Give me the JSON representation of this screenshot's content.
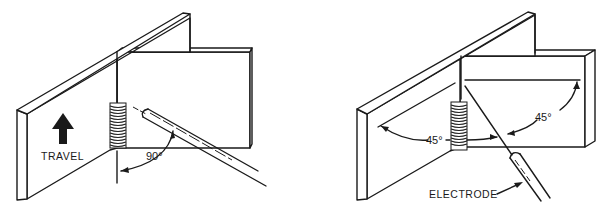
{
  "figures": [
    {
      "id": "left",
      "description": "Vertical fillet weld, electrode perpendicular to plate",
      "travel_label": "TRAVEL",
      "angle_label": "90°"
    },
    {
      "id": "right",
      "description": "Vertical fillet weld, electrode bisecting joint",
      "angle_label_left": "45°",
      "angle_label_right": "45°",
      "electrode_label": "ELECTRODE"
    }
  ],
  "colors": {
    "ink": "#1a1a1a",
    "background": "#ffffff"
  }
}
